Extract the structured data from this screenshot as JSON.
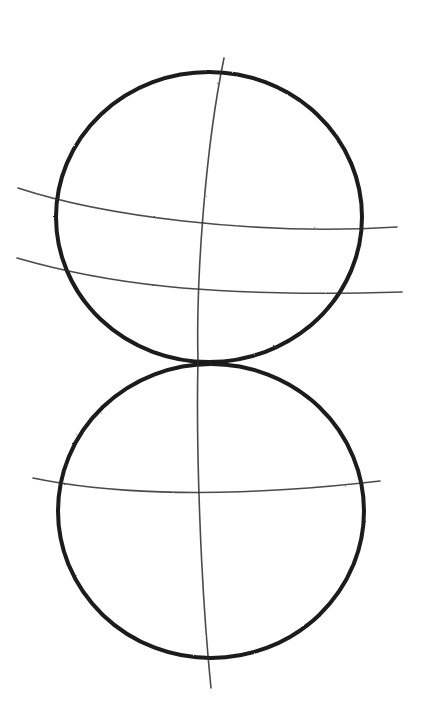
{
  "image": {
    "description": "Pencil sketch of two stacked circles with curved construction guidelines",
    "background": "#ffffff",
    "stroke_color": "#1a1a1a",
    "guide_color": "#2b2b2b"
  },
  "shapes": {
    "top_circle": {
      "cx": 209,
      "cy": 217,
      "rx": 153,
      "ry": 145
    },
    "bottom_circle": {
      "cx": 211,
      "cy": 511,
      "rx": 153,
      "ry": 147
    }
  },
  "guides": {
    "vertical_axis": "M 224 58 C 205 150, 196 280, 198 360 C 196 440, 200 580, 211 688",
    "top_horizontal_1": "M 18 188 C 100 215, 250 236, 397 227",
    "top_horizontal_2": "M 17 258 C 100 282, 200 298, 402 292",
    "bottom_horizontal": "M 33 478 C 90 490, 200 502, 380 481"
  }
}
